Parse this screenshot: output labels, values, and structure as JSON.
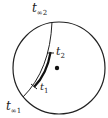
{
  "figure": {
    "type": "circle-with-geodesic-arc",
    "stroke_color": "#222222",
    "background": "#ffffff",
    "circle": {
      "cx": 59,
      "cy": 68,
      "r": 46
    },
    "center_dot": {
      "cx": 57,
      "cy": 68,
      "r": 2.2
    }
  },
  "labels": {
    "t_inf2": {
      "base": "t",
      "sub": "∞2"
    },
    "t_inf1": {
      "base": "t",
      "sub": "∞1"
    },
    "t2": {
      "base": "t",
      "sub": "2"
    },
    "t1": {
      "base": "t",
      "sub": "1"
    }
  }
}
